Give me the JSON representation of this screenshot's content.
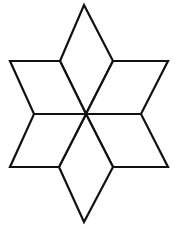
{
  "figure": {
    "stroke_color": "#111111",
    "fill_color": "#ffffff",
    "rhombus_count": 6,
    "rhombi": [
      {
        "name": "top"
      },
      {
        "name": "upper-right"
      },
      {
        "name": "lower-right"
      },
      {
        "name": "bottom"
      },
      {
        "name": "lower-left"
      },
      {
        "name": "upper-left"
      }
    ]
  }
}
